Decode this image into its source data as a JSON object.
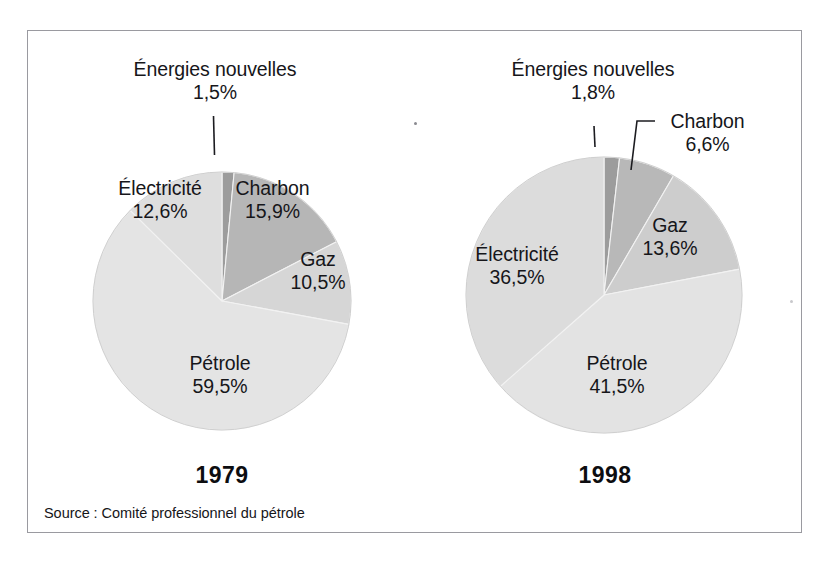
{
  "figure": {
    "source_note": "Source : Comité professionnel du pétrole",
    "frame_color": "#9a9aa0"
  },
  "charts": [
    {
      "id": "pie-1979",
      "year_label": "1979",
      "center": [
        222,
        301
      ],
      "radius": 129,
      "slices": [
        {
          "name": "Énergies nouvelles",
          "value": 1.5,
          "pct_label": "1,5%",
          "color": "#9c9c9c"
        },
        {
          "name": "Charbon",
          "value": 15.9,
          "pct_label": "15,9%",
          "color": "#b6b6b6"
        },
        {
          "name": "Gaz",
          "value": 10.5,
          "pct_label": "10,5%",
          "color": "#d6d6d6"
        },
        {
          "name": "Pétrole",
          "value": 59.5,
          "pct_label": "59,5%",
          "color": "#e4e4e4"
        },
        {
          "name": "Électricité",
          "value": 12.6,
          "pct_label": "12,6%",
          "color": "#dedede"
        }
      ]
    },
    {
      "id": "pie-1998",
      "year_label": "1998",
      "center": [
        604,
        295
      ],
      "radius": 138,
      "slices": [
        {
          "name": "Énergies nouvelles",
          "value": 1.8,
          "pct_label": "1,8%",
          "color": "#9c9c9c"
        },
        {
          "name": "Charbon",
          "value": 6.6,
          "pct_label": "6,6%",
          "color": "#b8b8b8"
        },
        {
          "name": "Gaz",
          "value": 13.6,
          "pct_label": "13,6%",
          "color": "#cdcdcd"
        },
        {
          "name": "Pétrole",
          "value": 41.5,
          "pct_label": "41,5%",
          "color": "#e3e3e3"
        },
        {
          "name": "Électricité",
          "value": 36.5,
          "pct_label": "36,5%",
          "color": "#dcdcdc"
        }
      ]
    }
  ],
  "labels_1979": {
    "energies": {
      "name": "Énergies nouvelles",
      "pct": "1,5%"
    },
    "electricite": {
      "name": "Électricité",
      "pct": "12,6%"
    },
    "charbon": {
      "name": "Charbon",
      "pct": "15,9%"
    },
    "gaz": {
      "name": "Gaz",
      "pct": "10,5%"
    },
    "petrole": {
      "name": "Pétrole",
      "pct": "59,5%"
    }
  },
  "labels_1998": {
    "energies": {
      "name": "Énergies nouvelles",
      "pct": "1,8%"
    },
    "charbon": {
      "name": "Charbon",
      "pct": "6,6%"
    },
    "electricite": {
      "name": "Électricité",
      "pct": "36,5%"
    },
    "gaz": {
      "name": "Gaz",
      "pct": "13,6%"
    },
    "petrole": {
      "name": "Pétrole",
      "pct": "41,5%"
    }
  },
  "chart_data": [
    {
      "type": "pie",
      "title": "1979",
      "categories": [
        "Énergies nouvelles",
        "Charbon",
        "Gaz",
        "Pétrole",
        "Électricité"
      ],
      "values": [
        1.5,
        15.9,
        10.5,
        59.5,
        12.6
      ],
      "value_labels": [
        "1,5%",
        "15,9%",
        "10,5%",
        "59,5%",
        "12,6%"
      ],
      "unit": "%",
      "start_angle_deg": 0,
      "direction": "clockwise",
      "legend": "none (labels on slices)",
      "colors": [
        "#9c9c9c",
        "#b6b6b6",
        "#d6d6d6",
        "#e4e4e4",
        "#dedede"
      ]
    },
    {
      "type": "pie",
      "title": "1998",
      "categories": [
        "Énergies nouvelles",
        "Charbon",
        "Gaz",
        "Pétrole",
        "Électricité"
      ],
      "values": [
        1.8,
        6.6,
        13.6,
        41.5,
        36.5
      ],
      "value_labels": [
        "1,8%",
        "6,6%",
        "13,6%",
        "41,5%",
        "36,5%"
      ],
      "unit": "%",
      "start_angle_deg": 0,
      "direction": "clockwise",
      "legend": "none (labels on slices)",
      "colors": [
        "#9c9c9c",
        "#b8b8b8",
        "#cdcdcd",
        "#e3e3e3",
        "#dcdcdc"
      ]
    }
  ]
}
